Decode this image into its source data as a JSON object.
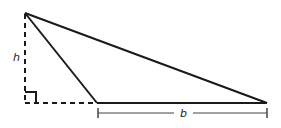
{
  "diagram": {
    "labels": {
      "height": "h",
      "base": "b"
    },
    "colors": {
      "stroke": "#1a1a1a",
      "dim": "#444444",
      "background": "#ffffff"
    },
    "points": {
      "apex": [
        25,
        13
      ],
      "foot": [
        25,
        103
      ],
      "base_left": [
        97,
        103
      ],
      "base_right": [
        267,
        103
      ]
    },
    "annotations": {
      "right_angle_marker": true,
      "height_dashed": true,
      "base_extension_dashed": true,
      "base_dimension_line_y": 113
    }
  }
}
